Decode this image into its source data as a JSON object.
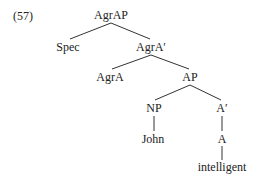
{
  "example_number": "(57)",
  "tree": {
    "nodes": [
      {
        "id": "agrap",
        "label": "AgrAP",
        "x": 111,
        "y": 15
      },
      {
        "id": "spec",
        "label": "Spec",
        "x": 68,
        "y": 47
      },
      {
        "id": "agra_bar",
        "label": "AgrA′",
        "x": 151,
        "y": 47
      },
      {
        "id": "agra",
        "label": "AgrA",
        "x": 110,
        "y": 77
      },
      {
        "id": "ap",
        "label": "AP",
        "x": 190,
        "y": 77
      },
      {
        "id": "np",
        "label": "NP",
        "x": 154,
        "y": 108
      },
      {
        "id": "a_bar",
        "label": "A′",
        "x": 222,
        "y": 108
      },
      {
        "id": "john",
        "label": "John",
        "x": 153,
        "y": 139
      },
      {
        "id": "a",
        "label": "A",
        "x": 222,
        "y": 139
      },
      {
        "id": "intelligent",
        "label": "intelligent",
        "x": 222,
        "y": 167
      }
    ],
    "edges": [
      {
        "from": "agrap",
        "to": "spec"
      },
      {
        "from": "agrap",
        "to": "agra_bar"
      },
      {
        "from": "agra_bar",
        "to": "agra"
      },
      {
        "from": "agra_bar",
        "to": "ap"
      },
      {
        "from": "ap",
        "to": "np"
      },
      {
        "from": "ap",
        "to": "a_bar"
      },
      {
        "from": "np",
        "to": "john"
      },
      {
        "from": "a_bar",
        "to": "a"
      },
      {
        "from": "a",
        "to": "intelligent"
      }
    ]
  }
}
